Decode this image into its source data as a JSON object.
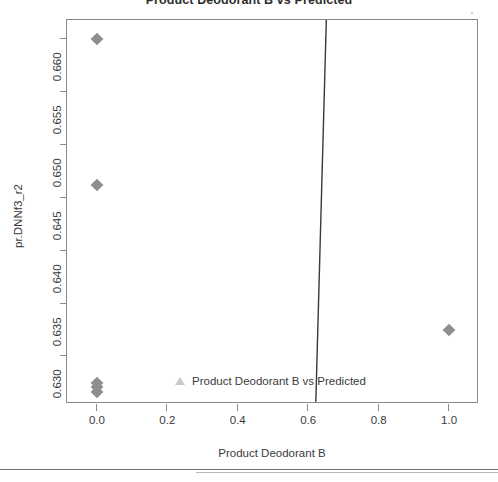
{
  "chart_data": {
    "type": "scatter",
    "title": "Product Deodorant B vs Predicted",
    "xlabel": "Product Deodorant B",
    "ylabel": "pr.DNNf3_r2",
    "xlim": [
      -0.085,
      1.085
    ],
    "ylim": [
      0.6255,
      0.6618
    ],
    "grid": false,
    "x_ticks": [
      {
        "value": 0.0,
        "label": "0.0"
      },
      {
        "value": 0.2,
        "label": "0.2"
      },
      {
        "value": 0.4,
        "label": "0.4"
      },
      {
        "value": 0.6,
        "label": "0.6"
      },
      {
        "value": 0.8,
        "label": "0.8"
      },
      {
        "value": 1.0,
        "label": "1.0"
      }
    ],
    "y_ticks": [
      {
        "value": 0.63,
        "label": "0.630"
      },
      {
        "value": 0.635,
        "label": "0.635"
      },
      {
        "value": 0.64,
        "label": "0.640"
      },
      {
        "value": 0.645,
        "label": "0.645"
      },
      {
        "value": 0.65,
        "label": "0.650"
      },
      {
        "value": 0.655,
        "label": "0.655"
      },
      {
        "value": 0.66,
        "label": "0.660"
      }
    ],
    "series": [
      {
        "name": "observed",
        "marker": "filled-diamond",
        "color": "#8e8e8e",
        "points": [
          {
            "x": 0.0,
            "y": 0.66
          },
          {
            "x": 0.0,
            "y": 0.6462
          },
          {
            "x": 0.0,
            "y": 0.6275
          },
          {
            "x": 0.0,
            "y": 0.6271
          },
          {
            "x": 0.0,
            "y": 0.6266
          },
          {
            "x": 1.0,
            "y": 0.6325
          }
        ]
      }
    ],
    "fit_line": {
      "name": "fit",
      "color": "#3a3a3a",
      "x_at_ymax": 0.655,
      "x_at_ymin": 0.625
    },
    "legend": {
      "position": "inside-bottom-center",
      "marker": "open-triangle",
      "marker_color": "#c9c9c9",
      "label": "Product Deodorant B vs Predicted"
    }
  },
  "accents": {
    "frame": "#8a8a8a",
    "text": "#3b3b3b",
    "marker": "#8e8e8e",
    "line": "#3a3a3a",
    "divider": "#6f6f6f"
  }
}
